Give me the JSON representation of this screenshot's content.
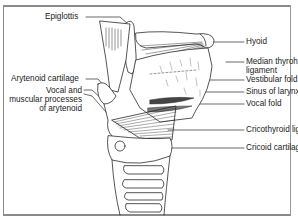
{
  "diagram": {
    "labels_left": [
      {
        "id": "epiglottis",
        "text": "Epiglottis"
      },
      {
        "id": "arytenoid-cartilage",
        "text": "Arytenoid cartilage"
      },
      {
        "id": "vocal-muscular-processes",
        "lines": [
          "Vocal and",
          "muscular processes",
          "of arytenoid"
        ]
      }
    ],
    "labels_right": [
      {
        "id": "hyoid",
        "text": "Hyoid"
      },
      {
        "id": "median-thyrohyoid-ligament",
        "lines": [
          "Median thyrohyoid",
          "ligament"
        ]
      },
      {
        "id": "vestibular-fold",
        "text": "Vestibular fold"
      },
      {
        "id": "sinus-of-larynx",
        "text": "Sinus of larynx"
      },
      {
        "id": "vocal-fold",
        "text": "Vocal fold"
      },
      {
        "id": "cricothyroid-ligament",
        "text": "Cricothyroid ligament"
      },
      {
        "id": "cricoid-cartilage",
        "text": "Cricoid cartilage (ring)"
      }
    ],
    "colors": {
      "line": "#2a2a2a",
      "frame": "#8a8a8a",
      "text": "#1a1a1a"
    }
  }
}
